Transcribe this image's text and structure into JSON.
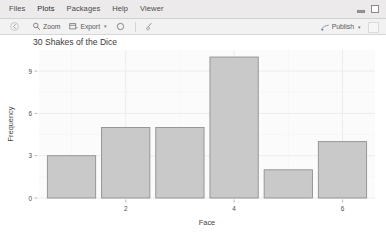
{
  "window": {
    "minimize_icon": "minimize-icon",
    "maximize_icon": "maximize-icon"
  },
  "tabs": [
    {
      "label": "Files",
      "name": "tab-files",
      "active": false
    },
    {
      "label": "Plots",
      "name": "tab-plots",
      "active": true
    },
    {
      "label": "Packages",
      "name": "tab-packages",
      "active": false
    },
    {
      "label": "Help",
      "name": "tab-help",
      "active": false
    },
    {
      "label": "Viewer",
      "name": "tab-viewer",
      "active": false
    }
  ],
  "toolbar": {
    "back_icon": "back-arrow-icon",
    "zoom_label": "Zoom",
    "zoom_icon": "magnifier-icon",
    "export_label": "Export",
    "export_icon": "export-icon",
    "export_caret": "▾",
    "remove_icon": "remove-plot-icon",
    "clear_icon": "broom-icon",
    "publish_label": "Publish",
    "publish_icon": "publish-icon",
    "publish_caret": "▾",
    "refresh_icon": "refresh-icon"
  },
  "chart_data": {
    "type": "bar",
    "title": "30 Shakes of the Dice",
    "xlabel": "Face",
    "ylabel": "Frequency",
    "categories": [
      1,
      2,
      3,
      4,
      5,
      6
    ],
    "values": [
      3,
      5,
      5,
      10,
      2,
      4
    ],
    "x_ticks": [
      2,
      4,
      6
    ],
    "y_ticks": [
      0,
      3,
      6,
      9
    ],
    "xlim": [
      0.4,
      6.6
    ],
    "ylim": [
      0,
      10.5
    ],
    "grid": true,
    "legend": "none",
    "bar_fill": "#c9c9c9",
    "bar_stroke": "#8f8f8f",
    "panel_background": "#fbfbfb",
    "grid_color": "#ececec",
    "text_color": "#4d4d4d"
  }
}
